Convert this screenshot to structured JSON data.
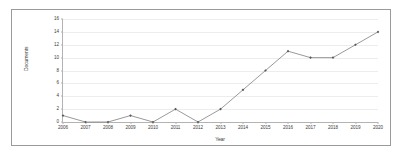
{
  "chart_data": {
    "type": "line",
    "title": "",
    "xlabel": "Year",
    "ylabel": "Documents",
    "categories": [
      "2006",
      "2007",
      "2008",
      "2009",
      "2010",
      "2011",
      "2012",
      "2013",
      "2014",
      "2015",
      "2016",
      "2017",
      "2018",
      "2019",
      "2020"
    ],
    "values": [
      1,
      0,
      0,
      1,
      0,
      2,
      0,
      2,
      5,
      8,
      11,
      10,
      10,
      12,
      14
    ],
    "series": [
      {
        "name": "Documents",
        "values": [
          1,
          0,
          0,
          1,
          0,
          2,
          0,
          2,
          5,
          8,
          11,
          10,
          10,
          12,
          14
        ]
      }
    ],
    "ylim": [
      0,
      16
    ],
    "xlim_categories": [
      "2006",
      "2020"
    ],
    "ytick_labels": [
      "0",
      "2",
      "4",
      "6",
      "8",
      "10",
      "12",
      "14",
      "16"
    ],
    "ytick_values": [
      0,
      2,
      4,
      6,
      8,
      10,
      12,
      14,
      16
    ],
    "xtick_labels": [
      "2006",
      "2007",
      "2008",
      "2009",
      "2010",
      "2011",
      "2012",
      "2013",
      "2014",
      "2015",
      "2016",
      "2017",
      "2018",
      "2019",
      "2020"
    ],
    "grid": "horizontal",
    "legend": "none",
    "line_color": "#7f7f7f",
    "marker_color": "#595959",
    "marker_shape": "diamond",
    "grid_color": "#ededed",
    "axis_color": "#b3b3b3",
    "frame_color": "#9a9a9a",
    "background_color": "#ffffff"
  }
}
